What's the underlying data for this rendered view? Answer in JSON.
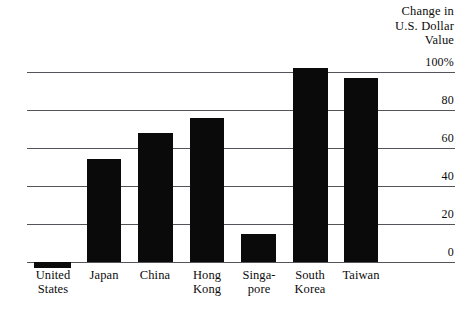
{
  "chart_data": {
    "type": "bar",
    "title": "Change in U.S. Dollar Value",
    "title_lines": [
      "Change in",
      "U.S. Dollar",
      "Value"
    ],
    "xlabel": "",
    "ylabel": "Change in U.S. Dollar Value",
    "ylim": [
      -10,
      105
    ],
    "grid": true,
    "legend": "none",
    "categories": [
      "United States",
      "Japan",
      "China",
      "Hong Kong",
      "Singapore",
      "South Korea",
      "Taiwan"
    ],
    "category_label_lines": [
      [
        "United",
        "States"
      ],
      [
        "Japan",
        ""
      ],
      [
        "China",
        ""
      ],
      [
        "Hong",
        "Kong"
      ],
      [
        "Singa-",
        "pore"
      ],
      [
        "South",
        "Korea"
      ],
      [
        "Taiwan",
        ""
      ]
    ],
    "values": [
      -3,
      54,
      68,
      76,
      15,
      102,
      97
    ],
    "yticks": [
      100,
      80,
      60,
      40,
      20,
      0
    ],
    "ytick_labels": [
      "100%",
      "80",
      "60",
      "40",
      "20",
      "0"
    ],
    "bar_color": "#0a0a0a",
    "grid_color": "#55545a"
  },
  "axis": {
    "tick_0": "100%",
    "tick_1": "80",
    "tick_2": "60",
    "tick_3": "40",
    "tick_4": "20",
    "tick_5": "0"
  },
  "title": {
    "line1": "Change in",
    "line2": "U.S. Dollar",
    "line3": "Value"
  },
  "labels": {
    "us_l1": "United",
    "us_l2": "States",
    "japan_l1": "Japan",
    "china_l1": "China",
    "hk_l1": "Hong",
    "hk_l2": "Kong",
    "sg_l1": "Singa-",
    "sg_l2": "pore",
    "kr_l1": "South",
    "kr_l2": "Korea",
    "tw_l1": "Taiwan"
  }
}
